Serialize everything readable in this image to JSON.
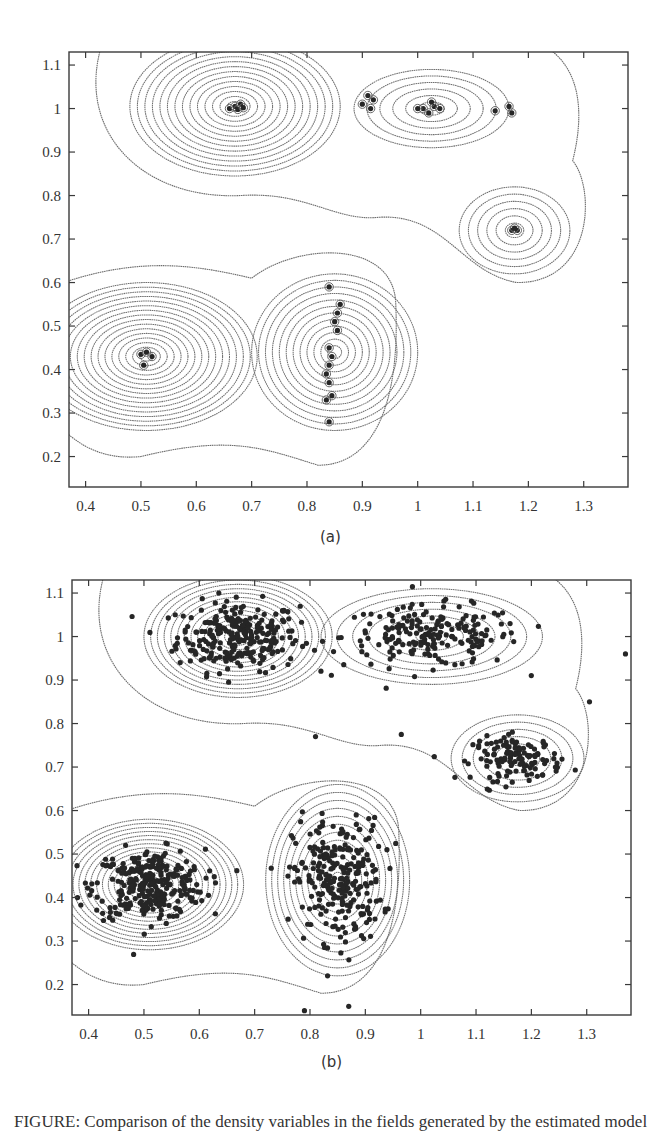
{
  "chart_data": [
    {
      "type": "scatter",
      "subtype": "contour-with-points",
      "panel": "a",
      "caption": "(a)",
      "xlim": [
        0.37,
        1.38
      ],
      "ylim": [
        0.13,
        1.13
      ],
      "xticks": [
        0.4,
        0.5,
        0.6,
        0.7,
        0.8,
        0.9,
        1,
        1.1,
        1.2,
        1.3
      ],
      "xtick_labels": [
        "0.4",
        "0.5",
        "0.6",
        "0.7",
        "0.8",
        "0.9",
        "1",
        "1.1",
        "1.2",
        "1.3"
      ],
      "yticks": [
        0.2,
        0.3,
        0.4,
        0.5,
        0.6,
        0.7,
        0.8,
        0.9,
        1,
        1.1
      ],
      "ytick_labels": [
        "0.2",
        "0.3",
        "0.4",
        "0.5",
        "0.6",
        "0.7",
        "0.8",
        "0.9",
        "1",
        "1.1"
      ],
      "grid": false,
      "xlabel": "",
      "ylabel": "",
      "title": "",
      "frame_px": {
        "left": 69,
        "top": 52,
        "right": 628,
        "bottom": 487
      },
      "clusters": [
        {
          "cx": 0.67,
          "cy": 1.005,
          "rx": 0.19,
          "ry": 0.16,
          "levels": 14,
          "points": [
            [
              0.66,
              1.0
            ],
            [
              0.67,
              1.005
            ],
            [
              0.68,
              1.01
            ],
            [
              0.675,
              0.998
            ],
            [
              0.685,
              1.002
            ]
          ]
        },
        {
          "cx": 1.025,
          "cy": 1.0,
          "rx": 0.14,
          "ry": 0.09,
          "levels": 6,
          "points": [
            [
              1.01,
              1.0
            ],
            [
              1.02,
              0.99
            ],
            [
              1.03,
              1.005
            ],
            [
              1.04,
              1.0
            ],
            [
              1.025,
              1.015
            ],
            [
              1.0,
              1.0
            ]
          ]
        },
        {
          "cx": 0.51,
          "cy": 0.43,
          "rx": 0.2,
          "ry": 0.17,
          "levels": 16,
          "points": [
            [
              0.5,
              0.435
            ],
            [
              0.51,
              0.44
            ],
            [
              0.52,
              0.43
            ],
            [
              0.505,
              0.41
            ]
          ]
        },
        {
          "cx": 0.85,
          "cy": 0.44,
          "rx": 0.15,
          "ry": 0.18,
          "levels": 12,
          "points": [
            [
              0.84,
              0.59
            ],
            [
              0.86,
              0.55
            ],
            [
              0.855,
              0.53
            ],
            [
              0.85,
              0.51
            ],
            [
              0.855,
              0.49
            ],
            [
              0.84,
              0.45
            ],
            [
              0.845,
              0.43
            ],
            [
              0.84,
              0.41
            ],
            [
              0.835,
              0.39
            ],
            [
              0.84,
              0.37
            ],
            [
              0.845,
              0.34
            ],
            [
              0.835,
              0.33
            ],
            [
              0.84,
              0.28
            ]
          ]
        },
        {
          "cx": 1.175,
          "cy": 0.72,
          "rx": 0.1,
          "ry": 0.1,
          "levels": 6,
          "points": [
            [
              1.17,
              0.72
            ],
            [
              1.18,
              0.72
            ],
            [
              1.175,
              0.725
            ]
          ]
        }
      ],
      "isolated_points": [
        [
          0.9,
          1.01
        ],
        [
          0.91,
          1.03
        ],
        [
          0.92,
          1.02
        ],
        [
          0.915,
          1.0
        ],
        [
          1.14,
          0.995
        ],
        [
          1.165,
          1.005
        ],
        [
          1.17,
          0.99
        ]
      ]
    },
    {
      "type": "scatter",
      "subtype": "contour-with-points",
      "panel": "b",
      "caption": "(b)",
      "xlim": [
        0.37,
        1.38
      ],
      "ylim": [
        0.13,
        1.13
      ],
      "xticks": [
        0.4,
        0.5,
        0.6,
        0.7,
        0.8,
        0.9,
        1,
        1.1,
        1.2,
        1.3
      ],
      "xtick_labels": [
        "0.4",
        "0.5",
        "0.6",
        "0.7",
        "0.8",
        "0.9",
        "1",
        "1.1",
        "1.2",
        "1.3"
      ],
      "yticks": [
        0.2,
        0.3,
        0.4,
        0.5,
        0.6,
        0.7,
        0.8,
        0.9,
        1,
        1.1
      ],
      "ytick_labels": [
        "0.2",
        "0.3",
        "0.4",
        "0.5",
        "0.6",
        "0.7",
        "0.8",
        "0.9",
        "1",
        "1.1"
      ],
      "grid": false,
      "xlabel": "",
      "ylabel": "",
      "title": "",
      "frame_px": {
        "left": 72,
        "top": 580,
        "right": 631,
        "bottom": 1015
      },
      "clusters": [
        {
          "cx": 0.67,
          "cy": 1.0,
          "rx": 0.17,
          "ry": 0.14,
          "levels": 14,
          "n_points": 260,
          "sx": 0.055,
          "sy": 0.04
        },
        {
          "cx": 1.02,
          "cy": 1.0,
          "rx": 0.2,
          "ry": 0.11,
          "levels": 7,
          "n_points": 200,
          "sx": 0.08,
          "sy": 0.035
        },
        {
          "cx": 0.51,
          "cy": 0.43,
          "rx": 0.17,
          "ry": 0.15,
          "levels": 16,
          "n_points": 300,
          "sx": 0.05,
          "sy": 0.04
        },
        {
          "cx": 0.85,
          "cy": 0.44,
          "rx": 0.13,
          "ry": 0.22,
          "levels": 12,
          "n_points": 260,
          "sx": 0.04,
          "sy": 0.07
        },
        {
          "cx": 1.175,
          "cy": 0.72,
          "rx": 0.12,
          "ry": 0.1,
          "levels": 6,
          "n_points": 130,
          "sx": 0.04,
          "sy": 0.025
        }
      ],
      "isolated_points": [
        [
          0.81,
          0.77
        ],
        [
          0.965,
          0.775
        ],
        [
          1.37,
          0.96
        ],
        [
          1.305,
          0.85
        ],
        [
          0.79,
          0.14
        ],
        [
          0.87,
          0.15
        ],
        [
          0.38,
          0.4
        ]
      ]
    }
  ],
  "captions": {
    "a": "(a)",
    "b": "(b)",
    "figure": "FIGURE: Comparison of the density variables in the fields generated by the estimated model"
  }
}
